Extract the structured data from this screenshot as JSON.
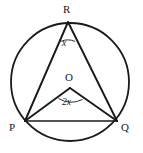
{
  "figure": {
    "background_color": "#ffffff",
    "stroke_color": "#1a1a1a",
    "text_color": "#1a1a1a"
  },
  "circle": {
    "name": "main-circle",
    "center_x": 70,
    "center_y": 82,
    "radius": 59,
    "stroke_width": 1.8
  },
  "points": [
    {
      "id": "R",
      "label": "R",
      "x": 68,
      "y": 22,
      "label_x": 63,
      "label_y": 4
    },
    {
      "id": "O",
      "label": "O",
      "x": 70,
      "y": 88,
      "label_x": 65,
      "label_y": 72
    },
    {
      "id": "P",
      "label": "P",
      "x": 25,
      "y": 121,
      "label_x": 9,
      "label_y": 122
    },
    {
      "id": "Q",
      "label": "Q",
      "x": 117,
      "y": 121,
      "label_x": 121,
      "label_y": 122
    }
  ],
  "segments": [
    {
      "id": "RP",
      "from": "R",
      "to": "P",
      "x1": 68,
      "y1": 22,
      "x2": 25,
      "y2": 121,
      "stroke_width": 1.9
    },
    {
      "id": "RQ",
      "from": "R",
      "to": "Q",
      "x1": 68,
      "y1": 22,
      "x2": 117,
      "y2": 121,
      "stroke_width": 1.9
    },
    {
      "id": "OP",
      "from": "O",
      "to": "P",
      "x1": 70,
      "y1": 88,
      "x2": 25,
      "y2": 121,
      "stroke_width": 1.9
    },
    {
      "id": "OQ",
      "from": "O",
      "to": "Q",
      "x1": 70,
      "y1": 88,
      "x2": 117,
      "y2": 121,
      "stroke_width": 1.9
    },
    {
      "id": "PQ",
      "from": "P",
      "to": "Q",
      "x1": 25,
      "y1": 121,
      "x2": 117,
      "y2": 121,
      "stroke_width": 1.7
    }
  ],
  "angles": [
    {
      "id": "angle-x",
      "at_point": "R",
      "label": "x",
      "label_x": 62,
      "label_y": 39,
      "arc_path": "M 60.5 41.5 Q 68 38.2 75.2 41.5",
      "stroke_width": 0.9
    },
    {
      "id": "angle-2x",
      "at_point": "O",
      "label": "2x",
      "label_x": 62,
      "label_y": 98,
      "arc_path": "M 58.5 98.5 Q 70 105.5 82.5 99.5",
      "stroke_width": 0.9
    }
  ]
}
